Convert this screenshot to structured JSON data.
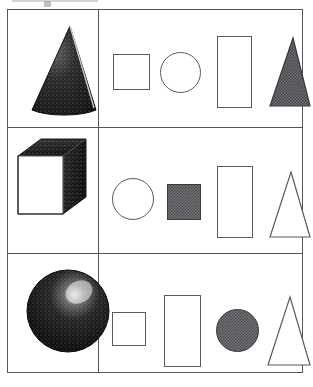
{
  "figure": {
    "type": "shape-matching-grid",
    "background_color": "#ffffff",
    "line_color": "#55565a",
    "shade_color": "#6f7073",
    "grid": {
      "rows": 3,
      "columns": 2
    }
  },
  "rows": [
    {
      "id": "row-1",
      "solid": {
        "name": "cone",
        "label": "cone",
        "fill": "shaded-dark",
        "apex": [
          62,
          16
        ],
        "base_center": [
          62,
          108
        ],
        "base_rx": 38,
        "base_ry": 11
      },
      "options": [
        {
          "id": "r1-o1",
          "name": "square",
          "label": "square",
          "fill": "outline",
          "x": 14,
          "y": 44,
          "w": 37,
          "h": 36
        },
        {
          "id": "r1-o2",
          "name": "circle",
          "label": "circle",
          "fill": "outline",
          "x": 61,
          "y": 42,
          "w": 41,
          "h": 41
        },
        {
          "id": "r1-o3",
          "name": "rectangle",
          "label": "rectangle",
          "fill": "outline",
          "x": 118,
          "y": 26,
          "w": 35,
          "h": 72
        },
        {
          "id": "r1-o4",
          "name": "triangle",
          "label": "triangle",
          "fill": "shaded",
          "x": 170,
          "y": 27,
          "w": 42,
          "h": 70
        }
      ]
    },
    {
      "id": "row-2",
      "solid": {
        "name": "cube",
        "label": "cube",
        "fill": "white-front-shaded-top-and-side",
        "front": [
          [
            10,
            28
          ],
          [
            55,
            28
          ],
          [
            55,
            86
          ],
          [
            10,
            86
          ]
        ],
        "top": [
          [
            10,
            28
          ],
          [
            33,
            11
          ],
          [
            78,
            11
          ],
          [
            55,
            28
          ]
        ],
        "side": [
          [
            55,
            28
          ],
          [
            78,
            11
          ],
          [
            78,
            69
          ],
          [
            55,
            86
          ]
        ]
      },
      "options": [
        {
          "id": "r2-o1",
          "name": "circle",
          "label": "circle",
          "fill": "outline",
          "x": 13,
          "y": 50,
          "w": 42,
          "h": 42
        },
        {
          "id": "r2-o2",
          "name": "square",
          "label": "square",
          "fill": "shaded",
          "x": 68,
          "y": 56,
          "w": 34,
          "h": 36
        },
        {
          "id": "r2-o3",
          "name": "rectangle",
          "label": "rectangle",
          "fill": "outline",
          "x": 118,
          "y": 38,
          "w": 36,
          "h": 72
        },
        {
          "id": "r2-o4",
          "name": "triangle",
          "label": "triangle",
          "fill": "outline",
          "x": 170,
          "y": 43,
          "w": 42,
          "h": 67
        }
      ]
    },
    {
      "id": "row-3",
      "solid": {
        "name": "sphere",
        "label": "sphere",
        "fill": "shaded-dark-with-highlight",
        "center": [
          60,
          57
        ],
        "radius": 41,
        "highlight_center": [
          72,
          39
        ]
      },
      "options": [
        {
          "id": "r3-o1",
          "name": "rectangle-small",
          "label": "rectangle",
          "fill": "outline",
          "x": 13,
          "y": 58,
          "w": 34,
          "h": 34
        },
        {
          "id": "r3-o2",
          "name": "rectangle-tall",
          "label": "rectangle",
          "fill": "outline",
          "x": 65,
          "y": 41,
          "w": 37,
          "h": 72
        },
        {
          "id": "r3-o3",
          "name": "circle",
          "label": "circle",
          "fill": "shaded",
          "x": 117,
          "y": 55,
          "w": 43,
          "h": 43
        },
        {
          "id": "r3-o4",
          "name": "triangle",
          "label": "triangle",
          "fill": "outline",
          "x": 168,
          "y": 42,
          "w": 44,
          "h": 70
        }
      ]
    }
  ]
}
